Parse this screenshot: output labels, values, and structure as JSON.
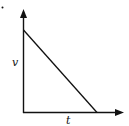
{
  "diagram": {
    "type": "velocity-time graph",
    "axes": {
      "y_label": "v",
      "x_label": "t"
    },
    "line": {
      "description": "straight line decreasing linearly from a value on the v-axis to zero on the t-axis"
    },
    "colors": {
      "stroke": "#111111",
      "background": "#ffffff"
    }
  }
}
